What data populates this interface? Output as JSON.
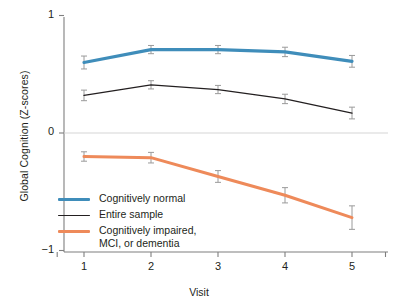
{
  "chart_data": {
    "type": "line",
    "title": "",
    "xlabel": "Visit",
    "ylabel": "Global Cognition (Z-scores)",
    "x": [
      1,
      2,
      3,
      4,
      5
    ],
    "xticklabels": [
      "1",
      "2",
      "3",
      "4",
      "5"
    ],
    "yticklabels": [
      "1",
      "0",
      "−1"
    ],
    "yticks": [
      1,
      0,
      -1
    ],
    "ylim": [
      -1,
      1
    ],
    "xlim": [
      0.6,
      5.5
    ],
    "grid": false,
    "zero_line": true,
    "legend_position": "lower left inside",
    "error_bars": "vertical capped",
    "series": [
      {
        "name": "Cognitively normal",
        "color": "#3f8dba",
        "linewidth": 3.2,
        "values": [
          0.6,
          0.71,
          0.71,
          0.69,
          0.61
        ],
        "err_low": [
          0.055,
          0.035,
          0.035,
          0.04,
          0.05
        ],
        "err_high": [
          0.055,
          0.035,
          0.035,
          0.04,
          0.05
        ]
      },
      {
        "name": "Entire sample",
        "color": "#231f20",
        "linewidth": 1.3,
        "values": [
          0.32,
          0.41,
          0.37,
          0.29,
          0.17
        ],
        "err_low": [
          0.045,
          0.035,
          0.035,
          0.04,
          0.05
        ],
        "err_high": [
          0.045,
          0.035,
          0.035,
          0.04,
          0.05
        ]
      },
      {
        "name": "Cognitively impaired,\nMCI, or dementia",
        "color": "#ee8a5a",
        "linewidth": 3.0,
        "values": [
          -0.2,
          -0.21,
          -0.37,
          -0.53,
          -0.72
        ],
        "err_low": [
          0.04,
          0.045,
          0.05,
          0.065,
          0.1
        ],
        "err_high": [
          0.04,
          0.045,
          0.05,
          0.065,
          0.1
        ]
      }
    ]
  },
  "legend": {
    "items": [
      {
        "label": "Cognitively normal",
        "color": "#3f8dba",
        "style": "thick"
      },
      {
        "label": "Entire sample",
        "color": "#231f20",
        "style": "thin"
      },
      {
        "label": "Cognitively impaired,\nMCI, or dementia",
        "color": "#ee8a5a",
        "style": "thick"
      }
    ]
  },
  "colors": {
    "axis": "#7f7f7f",
    "zero_line": "#d6d6d6",
    "background": "#ffffff",
    "text": "#231f20",
    "errorbar": "#9a9a9a"
  }
}
